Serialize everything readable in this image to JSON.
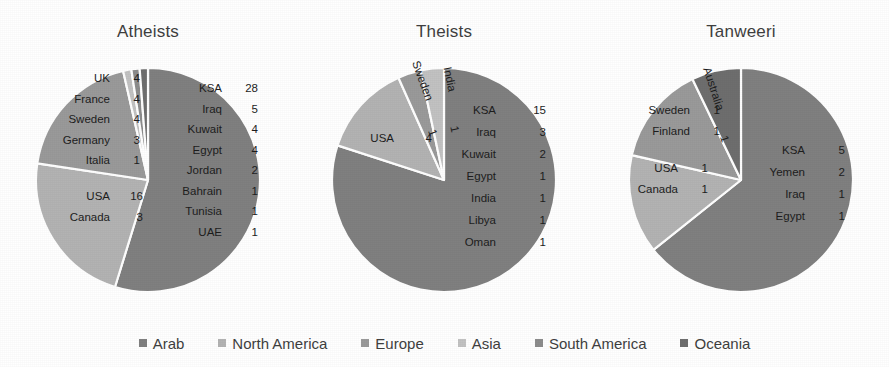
{
  "chart_data": [
    {
      "type": "pie",
      "title": "Atheists",
      "legend_position": "bottom",
      "categories": [
        "Arab",
        "North America",
        "Europe",
        "Asia",
        "South America",
        "Oceania"
      ],
      "values": [
        46,
        19,
        16,
        1,
        1,
        1
      ],
      "total": 84,
      "labels": {
        "Arab": [
          {
            "name": "KSA",
            "value": "28"
          },
          {
            "name": "Iraq",
            "value": "5"
          },
          {
            "name": "Kuwait",
            "value": "4"
          },
          {
            "name": "Egypt",
            "value": "4"
          },
          {
            "name": "Jordan",
            "value": "2"
          },
          {
            "name": "Bahrain",
            "value": "1"
          },
          {
            "name": "Tunisia",
            "value": "1"
          },
          {
            "name": "UAE",
            "value": "1"
          }
        ],
        "North America": [
          {
            "name": "USA",
            "value": "16"
          },
          {
            "name": "Canada",
            "value": "3"
          }
        ],
        "Europe": [
          {
            "name": "UK",
            "value": "4"
          },
          {
            "name": "France",
            "value": "4"
          },
          {
            "name": "Sweden",
            "value": "4"
          },
          {
            "name": "Germany",
            "value": "3"
          },
          {
            "name": "Italia",
            "value": "1"
          }
        ]
      }
    },
    {
      "type": "pie",
      "title": "Theists",
      "legend_position": "bottom",
      "categories": [
        "Arab",
        "North America",
        "Europe",
        "Asia"
      ],
      "values": [
        24,
        4,
        1,
        1
      ],
      "total": 30,
      "labels": {
        "Arab": [
          {
            "name": "KSA",
            "value": "15"
          },
          {
            "name": "Iraq",
            "value": "3"
          },
          {
            "name": "Kuwait",
            "value": "2"
          },
          {
            "name": "Egypt",
            "value": "1"
          },
          {
            "name": "India",
            "value": "1"
          },
          {
            "name": "Libya",
            "value": "1"
          },
          {
            "name": "Oman",
            "value": "1"
          }
        ],
        "North America": [
          {
            "name": "USA",
            "value": "4"
          }
        ],
        "Europe": [
          {
            "name": "Sweden",
            "value": "1"
          }
        ],
        "Asia": [
          {
            "name": "India",
            "value": "1"
          }
        ]
      }
    },
    {
      "type": "pie",
      "title": "Tanweeri",
      "legend_position": "bottom",
      "categories": [
        "Arab",
        "North America",
        "Europe",
        "Oceania"
      ],
      "values": [
        9,
        2,
        2,
        1
      ],
      "total": 14,
      "labels": {
        "Arab": [
          {
            "name": "KSA",
            "value": "5"
          },
          {
            "name": "Yemen",
            "value": "2"
          },
          {
            "name": "Iraq",
            "value": "1"
          },
          {
            "name": "Egypt",
            "value": "1"
          }
        ],
        "North America": [
          {
            "name": "USA",
            "value": "1"
          },
          {
            "name": "Canada",
            "value": "1"
          }
        ],
        "Europe": [
          {
            "name": "Sweden",
            "value": "1"
          },
          {
            "name": "Finland",
            "value": "1"
          }
        ],
        "Oceania": [
          {
            "name": "Australia",
            "value": "1"
          }
        ]
      }
    }
  ],
  "charts": {
    "atheists": {
      "title": "Atheists"
    },
    "theists": {
      "title": "Theists"
    },
    "tanweeri": {
      "title": "Tanweeri"
    }
  },
  "legend": {
    "items": [
      {
        "label": "Arab",
        "color": "#808080"
      },
      {
        "label": "North America",
        "color": "#b3b3b3"
      },
      {
        "label": "Europe",
        "color": "#9a9a9a"
      },
      {
        "label": "Asia",
        "color": "#c2c2c2"
      },
      {
        "label": "South America",
        "color": "#8c8c8c"
      },
      {
        "label": "Oceania",
        "color": "#6e6e6e"
      }
    ]
  },
  "colors": {
    "arab": "#808080",
    "north_america": "#b3b3b3",
    "europe": "#9a9a9a",
    "asia": "#c2c2c2",
    "south_america": "#8c8c8c",
    "oceania": "#6e6e6e",
    "background": "#ffffff",
    "title_text": "#3f3f3f",
    "label_text": "#1d1d1d",
    "slice_border": "#ffffff"
  }
}
